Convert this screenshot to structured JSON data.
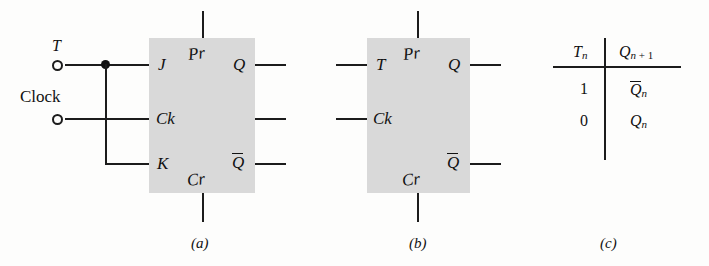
{
  "figure": {
    "background_color": "#fdfdfc",
    "box_fill_color": "#d9d9d9",
    "line_color": "#1c1c1c"
  },
  "panel_a": {
    "caption": "(a)",
    "inputs": [
      {
        "name": "T",
        "label": "T"
      },
      {
        "name": "Clock",
        "label": "Clock"
      }
    ],
    "pins": {
      "j": "J",
      "ck": "Ck",
      "k": "K",
      "pr": "Pr",
      "cr": "Cr",
      "q": "Q",
      "qbar": "Q"
    },
    "qbar_overbar": true
  },
  "panel_b": {
    "caption": "(b)",
    "pins": {
      "t": "T",
      "ck": "Ck",
      "pr": "Pr",
      "cr": "Cr",
      "q": "Q",
      "qbar": "Q"
    },
    "qbar_overbar": true
  },
  "panel_c": {
    "caption": "(c)",
    "table": {
      "headers": [
        {
          "base": "T",
          "sub": "n"
        },
        {
          "base": "Q",
          "sub": "n",
          "extra": " + 1"
        }
      ],
      "rows": [
        {
          "input": "1",
          "output_base": "Q",
          "output_sub": "n",
          "output_overbar": true
        },
        {
          "input": "0",
          "output_base": "Q",
          "output_sub": "n",
          "output_overbar": false
        }
      ]
    }
  }
}
